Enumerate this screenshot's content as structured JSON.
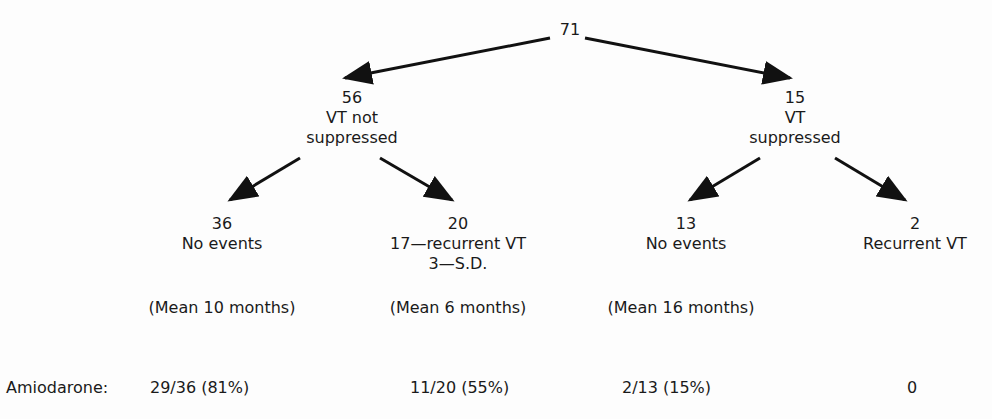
{
  "tree": {
    "root": {
      "count": "71"
    },
    "level1": [
      {
        "count": "56",
        "label_lines": [
          "VT not",
          "suppressed"
        ]
      },
      {
        "count": "15",
        "label_lines": [
          "VT",
          "suppressed"
        ]
      }
    ],
    "level2": [
      {
        "count": "36",
        "label_lines": [
          "No events"
        ],
        "mean": "(Mean 10 months)"
      },
      {
        "count": "20",
        "label_lines": [
          "17—recurrent VT",
          "3—S.D."
        ],
        "mean": "(Mean 6 months)"
      },
      {
        "count": "13",
        "label_lines": [
          "No events"
        ],
        "mean": "(Mean 16 months)"
      },
      {
        "count": "2",
        "label_lines": [
          "Recurrent VT"
        ],
        "mean": ""
      }
    ]
  },
  "amiodarone": {
    "label": "Amiodarone:",
    "values": [
      "29/36 (81%)",
      "11/20 (55%)",
      "2/13 (15%)",
      "0"
    ]
  }
}
